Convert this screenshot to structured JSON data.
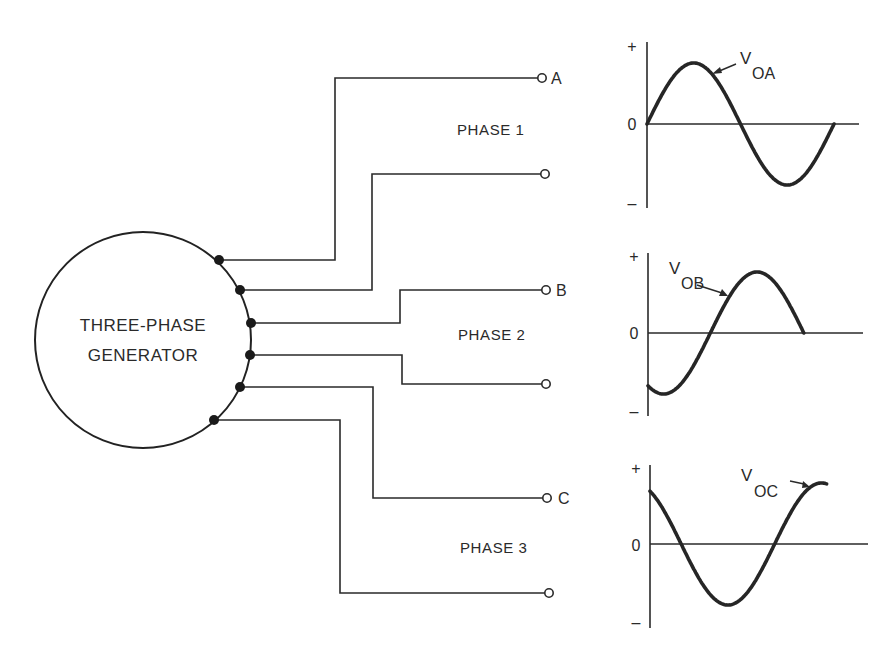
{
  "generator": {
    "label_line1": "THREE-PHASE",
    "label_line2": "GENERATOR"
  },
  "phases": [
    {
      "label": "PHASE 1",
      "terminal_top": "A",
      "terminal_bottom": ""
    },
    {
      "label": "PHASE 2",
      "terminal_top": "B",
      "terminal_bottom": ""
    },
    {
      "label": "PHASE 3",
      "terminal_top": "C",
      "terminal_bottom": ""
    }
  ],
  "waveforms": [
    {
      "axis_plus": "+",
      "axis_zero": "0",
      "axis_minus": "–",
      "label_main": "V",
      "label_sub": "OA"
    },
    {
      "axis_plus": "+",
      "axis_zero": "0",
      "axis_minus": "–",
      "label_main": "V",
      "label_sub": "OB"
    },
    {
      "axis_plus": "+",
      "axis_zero": "0",
      "axis_minus": "–",
      "label_main": "V",
      "label_sub": "OC"
    }
  ],
  "chart_data": [
    {
      "type": "line",
      "title": "V_OA",
      "xlabel": "",
      "ylabel": "",
      "ytick_labels": [
        "+",
        "0",
        "–"
      ],
      "grid": false,
      "phase_deg": 0,
      "x_range_deg": [
        0,
        360
      ],
      "x": [
        0,
        90,
        180,
        270,
        360
      ],
      "values": [
        0,
        1,
        0,
        -1,
        0
      ]
    },
    {
      "type": "line",
      "title": "V_OB",
      "xlabel": "",
      "ylabel": "",
      "ytick_labels": [
        "+",
        "0",
        "–"
      ],
      "grid": false,
      "phase_deg": -120,
      "x_range_deg": [
        0,
        300
      ],
      "x": [
        0,
        30,
        120,
        210,
        300
      ],
      "values": [
        -0.87,
        -1,
        0,
        1,
        0.87
      ]
    },
    {
      "type": "line",
      "title": "V_OC",
      "xlabel": "",
      "ylabel": "",
      "ytick_labels": [
        "+",
        "0",
        "–"
      ],
      "grid": false,
      "phase_deg": 120,
      "x_range_deg": [
        0,
        340
      ],
      "x": [
        0,
        60,
        150,
        240,
        330
      ],
      "values": [
        0.87,
        0,
        -1,
        0,
        1
      ]
    }
  ]
}
